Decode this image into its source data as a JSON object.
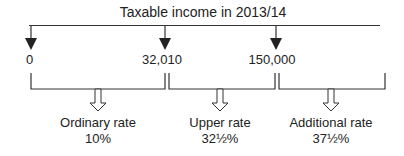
{
  "title": "Taxable income in 2013/14",
  "thresholds": [
    {
      "value": "0",
      "x": 31
    },
    {
      "value": "32,010",
      "x": 165
    },
    {
      "value": "150,000",
      "x": 276
    }
  ],
  "bands": [
    {
      "name": "Ordinary rate",
      "rate": "10%",
      "x": 98
    },
    {
      "name": "Upper rate",
      "rate": "32½%",
      "x": 222
    },
    {
      "name": "Additional rate",
      "rate": "37½%",
      "x": 331
    }
  ],
  "colors": {
    "line": "#333333",
    "text": "#222222"
  }
}
